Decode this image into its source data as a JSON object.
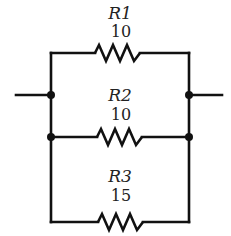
{
  "diagram": {
    "type": "parallel-resistor-circuit",
    "resistors": [
      {
        "name": "R1",
        "value": "10"
      },
      {
        "name": "R2",
        "value": "10"
      },
      {
        "name": "R3",
        "value": "15"
      }
    ],
    "colors": {
      "line": "#111111",
      "text": "#222222",
      "background": "#ffffff"
    }
  }
}
